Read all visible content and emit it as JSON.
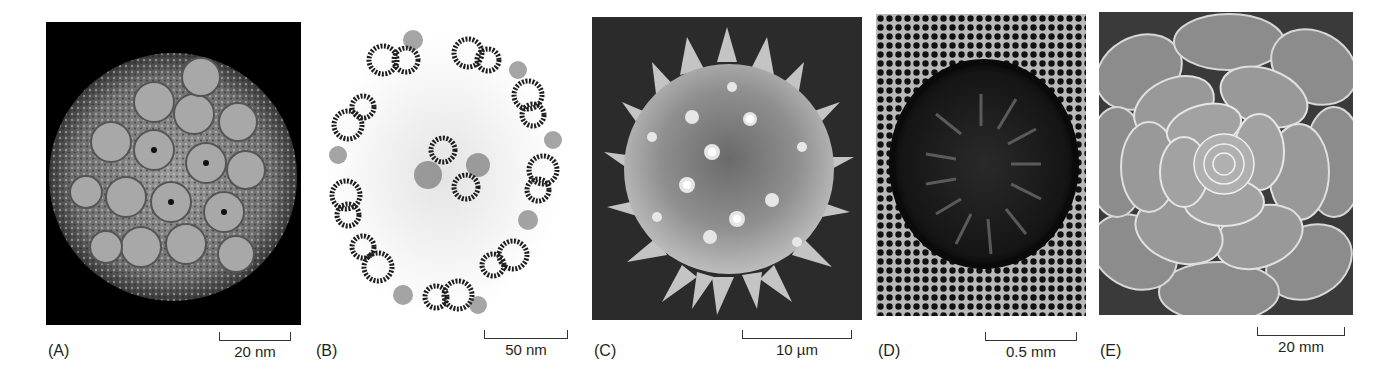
{
  "figure": {
    "panels": [
      {
        "id": "A",
        "label": "(A)",
        "scale": "20 nm",
        "subject": "virus capsid (cryo-EM reconstruction)",
        "background": "#000000"
      },
      {
        "id": "B",
        "label": "(B)",
        "scale": "50 nm",
        "subject": "axoneme cross-section (9+2 microtubules, TEM)",
        "background": "#ffffff"
      },
      {
        "id": "C",
        "label": "(C)",
        "scale": "10 µm",
        "subject": "spiky pollen grain (SEM)",
        "background": "#2a2a2a"
      },
      {
        "id": "D",
        "label": "(D)",
        "scale": "0.5 mm",
        "subject": "plant stem cross-section",
        "background": "#1a1a1a"
      },
      {
        "id": "E",
        "label": "(E)",
        "scale": "20 mm",
        "subject": "succulent rosette",
        "background": "#4a4a4a"
      }
    ]
  }
}
